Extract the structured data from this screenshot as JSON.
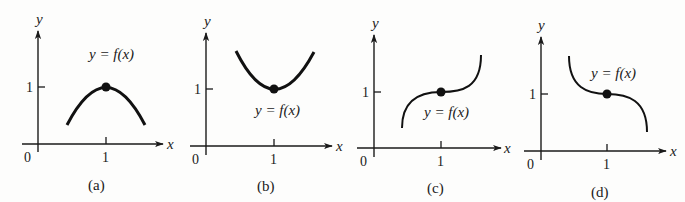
{
  "figure": {
    "panels": [
      {
        "id": "a",
        "caption": "(a)",
        "function_label": "y = f(x)",
        "description": "Concave-down curve with local maximum at (1, 1)",
        "axis_labels": {
          "x": "x",
          "y": "y"
        },
        "ticks": {
          "origin": "0",
          "x_tick": "1",
          "y_tick": "1"
        },
        "marked_point": {
          "x": 1,
          "y": 1
        }
      },
      {
        "id": "b",
        "caption": "(b)",
        "function_label": "y = f(x)",
        "description": "Concave-up curve with local minimum at (1, 1)",
        "axis_labels": {
          "x": "x",
          "y": "y"
        },
        "ticks": {
          "origin": "0",
          "x_tick": "1",
          "y_tick": "1"
        },
        "marked_point": {
          "x": 1,
          "y": 1
        }
      },
      {
        "id": "c",
        "caption": "(c)",
        "function_label": "y = f(x)",
        "description": "Increasing curve with horizontal inflection point at (1, 1)",
        "axis_labels": {
          "x": "x",
          "y": "y"
        },
        "ticks": {
          "origin": "0",
          "x_tick": "1",
          "y_tick": "1"
        },
        "marked_point": {
          "x": 1,
          "y": 1
        }
      },
      {
        "id": "d",
        "caption": "(d)",
        "function_label": "y = f(x)",
        "description": "Decreasing curve with horizontal inflection point at (1, 1)",
        "axis_labels": {
          "x": "x",
          "y": "y"
        },
        "ticks": {
          "origin": "0",
          "x_tick": "1",
          "y_tick": "1"
        },
        "marked_point": {
          "x": 1,
          "y": 1
        }
      }
    ]
  }
}
